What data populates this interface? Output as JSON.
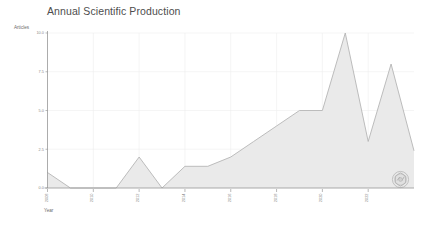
{
  "chart_data": {
    "type": "area",
    "title": "Annual Scientific Production",
    "xlabel": "Year",
    "ylabel": "Articles",
    "grid": true,
    "legend": false,
    "xlim": [
      2008,
      2024
    ],
    "ylim": [
      0,
      10
    ],
    "ytick_labels": [
      "0.0",
      "2.5",
      "5.0",
      "7.5",
      "10.0"
    ],
    "ytick_values": [
      0,
      2.5,
      5,
      7.5,
      10
    ],
    "xtick_labels": [
      "2008",
      "2010",
      "2012",
      "2014",
      "2016",
      "2018",
      "2020",
      "2022"
    ],
    "xtick_values": [
      2008,
      2010,
      2012,
      2014,
      2016,
      2018,
      2020,
      2022
    ],
    "categories": [
      2008,
      2009,
      2010,
      2011,
      2012,
      2013,
      2014,
      2015,
      2016,
      2017,
      2018,
      2019,
      2020,
      2021,
      2022,
      2023,
      2024
    ],
    "values": [
      1,
      0,
      0,
      0,
      2,
      0,
      1.4,
      1.4,
      2,
      3,
      4,
      5,
      5,
      10,
      3,
      8,
      2.4
    ],
    "series": [
      {
        "name": "Articles",
        "values": [
          1,
          0,
          0,
          0,
          2,
          0,
          1.4,
          1.4,
          2,
          3,
          4,
          5,
          5,
          10,
          3,
          8,
          2.4
        ]
      }
    ],
    "colors": {
      "area_fill": "#e9e9e9",
      "line_stroke": "#b5b5b5",
      "grid": "#eeeeee",
      "axis": "#8c8c8c",
      "title_text": "#4d4d4d",
      "tick_text": "#8a8a8a"
    }
  },
  "watermark": {
    "name": "logo-watermark"
  }
}
